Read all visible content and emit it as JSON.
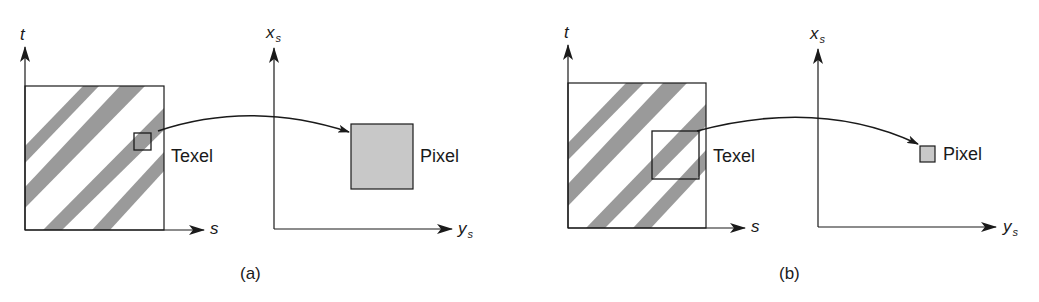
{
  "panels": [
    {
      "id": "a",
      "caption": "(a)",
      "texture_axes": {
        "vertical": "t",
        "horizontal": "s"
      },
      "screen_axes": {
        "vertical": "x",
        "vertical_sub": "s",
        "horizontal": "y",
        "horizontal_sub": "s"
      },
      "texel_label": "Texel",
      "pixel_label": "Pixel"
    },
    {
      "id": "b",
      "caption": "(b)",
      "texture_axes": {
        "vertical": "t",
        "horizontal": "s"
      },
      "screen_axes": {
        "vertical": "x",
        "vertical_sub": "s",
        "horizontal": "y",
        "horizontal_sub": "s"
      },
      "texel_label": "Texel",
      "pixel_label": "Pixel"
    }
  ],
  "colors": {
    "line": "#1a1a1a",
    "stripe": "#9a9a9a",
    "pixel_fill": "#c8c8c8"
  }
}
